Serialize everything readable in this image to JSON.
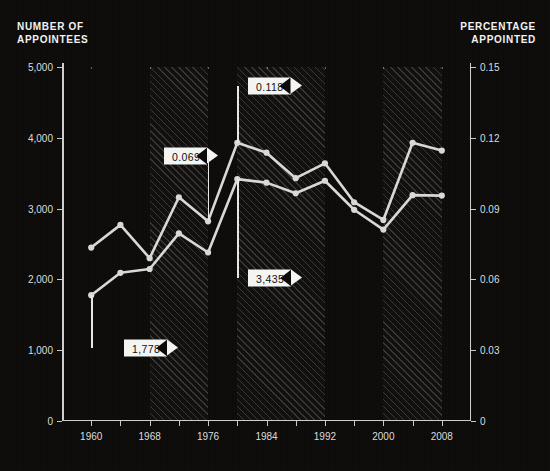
{
  "header": {
    "left_title": "NUMBER OF\nAPPOINTEES",
    "left_line1": "NUMBER OF",
    "left_line2": "APPOINTEES",
    "right_line1": "PERCENTAGE",
    "right_line2": "APPOINTED"
  },
  "chart_data": {
    "type": "line",
    "title": "",
    "xlabel": "",
    "ylabel": "Number of appointees",
    "y2label": "Percentage appointed",
    "grid": true,
    "legend": "none",
    "xlim": [
      1956,
      2012
    ],
    "xticks_major": [
      1960,
      1968,
      1976,
      1984,
      1992,
      2000,
      2008
    ],
    "xticks_all": [
      1960,
      1964,
      1968,
      1972,
      1976,
      1980,
      1984,
      1988,
      1992,
      1996,
      2000,
      2004,
      2008
    ],
    "ylim": [
      0,
      5000
    ],
    "yticks": [
      0,
      1000,
      2000,
      3000,
      4000,
      5000
    ],
    "ytick_labels": [
      "0",
      "1,000",
      "2,000",
      "3,000",
      "4,000",
      "5,000"
    ],
    "y2lim": [
      0,
      0.15
    ],
    "y2ticks": [
      0,
      0.03,
      0.06,
      0.09,
      0.12,
      0.15
    ],
    "y2tick_labels": [
      "0",
      "0.03",
      "0.06",
      "0.09",
      "0.12",
      "0.15"
    ],
    "x": [
      1960,
      1964,
      1968,
      1972,
      1976,
      1980,
      1984,
      1988,
      1992,
      1996,
      2000,
      2004,
      2008
    ],
    "series": [
      {
        "name": "Number of appointees",
        "axis": "left",
        "values": [
          2450,
          2770,
          2300,
          3160,
          2820,
          3930,
          3790,
          3430,
          3640,
          3090,
          2840,
          3930,
          3820
        ]
      },
      {
        "name": "Percentage appointed",
        "axis": "right",
        "values": [
          0.0533,
          0.0628,
          0.0644,
          0.0795,
          0.0714,
          0.1025,
          0.101,
          0.0965,
          0.1018,
          0.0895,
          0.0811,
          0.0957,
          0.0955
        ]
      }
    ],
    "annotations": [
      {
        "label": "1,778",
        "value": 1778,
        "x": 1960,
        "series": "Percentage appointed",
        "arrow": "right"
      },
      {
        "label": "0.069",
        "value": 0.069,
        "x": 1976,
        "series": "Percentage appointed",
        "arrow": "right"
      },
      {
        "label": "0.118",
        "value": 0.118,
        "x": 1980,
        "series": "Number of appointees",
        "arrow": "right"
      },
      {
        "label": "3,435",
        "value": 3435,
        "x": 1980,
        "series": "Number of appointees",
        "arrow": "right"
      }
    ],
    "shaded_bands": [
      {
        "start": 1968,
        "end": 1976,
        "style": "hatched"
      },
      {
        "start": 1980,
        "end": 1992,
        "style": "hatched"
      },
      {
        "start": 2000,
        "end": 2008,
        "style": "hatched"
      }
    ]
  },
  "colors": {
    "background": "#0c0b0a",
    "line": "#d8d8d6",
    "axis": "#cfcfcf",
    "text": "#e8e8e8",
    "flag_bg": "#f4f4f2",
    "flag_text": "#111111"
  }
}
